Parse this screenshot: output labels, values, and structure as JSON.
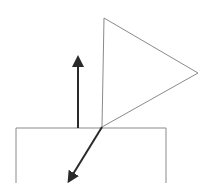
{
  "diagram": {
    "background": "#ffffff",
    "outline_color": "#8a8a8a",
    "arrow_color": "#2a2a2a",
    "shapes": {
      "box": {
        "label": "",
        "left": 16,
        "right": 166,
        "top": 128,
        "bottom": 183
      },
      "triangle": {
        "label": "",
        "points": [
          [
            104,
            18
          ],
          [
            198,
            73
          ],
          [
            102,
            127
          ]
        ]
      },
      "up_arrow": {
        "label": "",
        "from": [
          78,
          128
        ],
        "to": [
          78,
          54
        ]
      },
      "diagonal_arrow": {
        "label": "",
        "from": [
          102,
          127
        ],
        "to": [
          67,
          184
        ]
      }
    }
  }
}
